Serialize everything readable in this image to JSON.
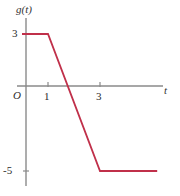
{
  "figure": {
    "background_color": "#ffffff",
    "axis_color": "#808080",
    "curve_color": "#c0304a",
    "text_color": "#2b2b2b"
  },
  "labels": {
    "y_axis_label": "g(t)",
    "x_axis_label": "t",
    "origin_label": "O",
    "y_tick_3": "3",
    "y_tick_neg5": "-5",
    "x_tick_1": "1",
    "x_tick_3": "3"
  },
  "chart_data": {
    "type": "line",
    "title": "",
    "xlabel": "t",
    "ylabel": "g(t)",
    "grid": false,
    "legend_position": "none",
    "xlim": [
      -0.3,
      5.2
    ],
    "ylim": [
      -6.5,
      4.5
    ],
    "xticks": [
      1,
      3
    ],
    "xtick_labels": [
      "1",
      "3"
    ],
    "yticks": [
      3,
      -5
    ],
    "ytick_labels": [
      "3",
      "-5"
    ],
    "series": [
      {
        "name": "g(t)",
        "color": "#c0304a",
        "x": [
          0,
          1,
          3,
          5.2
        ],
        "y": [
          3,
          3,
          -5,
          -5
        ],
        "segments": [
          {
            "from": [
              0,
              3
            ],
            "to": [
              1,
              3
            ],
            "description": "constant at 3"
          },
          {
            "from": [
              1,
              3
            ],
            "to": [
              3,
              -5
            ],
            "description": "linear decrease, slope -4, zero crossing at t = 1.75"
          },
          {
            "from": [
              3,
              -5
            ],
            "to": [
              5.2,
              -5
            ],
            "description": "constant at -5"
          }
        ]
      }
    ],
    "annotations": [
      {
        "text": "g(t)",
        "role": "y-axis-name"
      },
      {
        "text": "t",
        "role": "x-axis-name"
      },
      {
        "text": "O",
        "role": "origin"
      }
    ]
  }
}
